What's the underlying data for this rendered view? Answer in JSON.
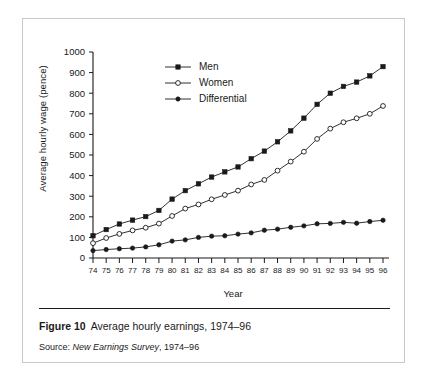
{
  "figure": {
    "number_label": "Figure 10",
    "title_text": "Average hourly earnings, 1974–96",
    "source_prefix": "Source:",
    "source_title": "New Earnings Survey",
    "source_suffix": ", 1974–96"
  },
  "chart_data": {
    "type": "line",
    "title": "Average hourly earnings, 1974–96",
    "xlabel": "Year",
    "ylabel": "Average hourly wage (pence)",
    "categories": [
      "74",
      "75",
      "76",
      "77",
      "78",
      "79",
      "80",
      "81",
      "82",
      "83",
      "84",
      "85",
      "86",
      "87",
      "88",
      "89",
      "90",
      "91",
      "92",
      "93",
      "94",
      "95",
      "96"
    ],
    "x": [
      1974,
      1975,
      1976,
      1977,
      1978,
      1979,
      1980,
      1981,
      1982,
      1983,
      1984,
      1985,
      1986,
      1987,
      1988,
      1989,
      1990,
      1991,
      1992,
      1993,
      1994,
      1995,
      1996
    ],
    "ylim": [
      0,
      1000
    ],
    "xlim": [
      1974,
      1996
    ],
    "ytick_values": [
      0,
      100,
      200,
      300,
      400,
      500,
      600,
      700,
      800,
      900,
      1000
    ],
    "ytick_labels": [
      "0",
      "100",
      "200",
      "300",
      "400",
      "500",
      "600",
      "700",
      "800",
      "900",
      "1000"
    ],
    "grid": false,
    "legend_position": "top-center",
    "series": [
      {
        "name": "Men",
        "marker": "filled-square",
        "color": "#1a1a1a",
        "values": [
          108,
          138,
          165,
          184,
          201,
          231,
          286,
          327,
          360,
          393,
          418,
          442,
          482,
          519,
          564,
          617,
          679,
          746,
          800,
          833,
          854,
          884,
          929
        ]
      },
      {
        "name": "Women",
        "marker": "open-circle",
        "color": "#1a1a1a",
        "values": [
          72,
          97,
          117,
          134,
          147,
          167,
          204,
          240,
          260,
          285,
          306,
          327,
          357,
          379,
          424,
          468,
          516,
          578,
          628,
          659,
          678,
          700,
          738
        ]
      },
      {
        "name": "Differential",
        "marker": "filled-circle",
        "color": "#1a1a1a",
        "values": [
          36,
          41,
          45,
          48,
          54,
          64,
          82,
          88,
          100,
          106,
          108,
          116,
          122,
          135,
          140,
          149,
          156,
          166,
          168,
          173,
          169,
          177,
          183
        ]
      }
    ]
  }
}
